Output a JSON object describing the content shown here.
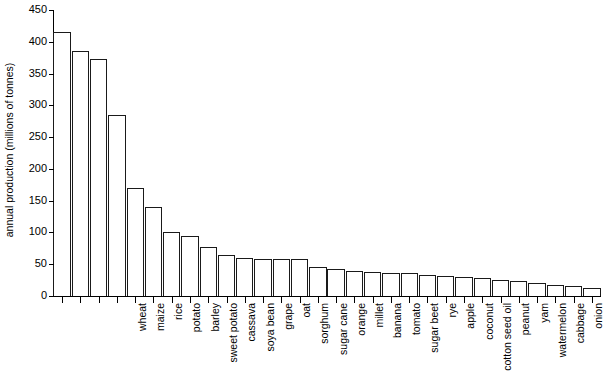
{
  "chart_data": {
    "type": "bar",
    "title": "",
    "xlabel": "",
    "ylabel": "annual production (millions of tonnes)",
    "ylim": [
      0,
      450
    ],
    "ytick_step": 50,
    "yticks": [
      0,
      50,
      100,
      150,
      200,
      250,
      300,
      350,
      400,
      450
    ],
    "ytick_labels": [
      "0",
      "50",
      "100",
      "150",
      "200",
      "250",
      "300",
      "350",
      "400",
      "450"
    ],
    "grid": false,
    "legend": null,
    "bar_color": "#ffffff",
    "bar_edge_color": "#1a1a1a",
    "axis_color": "#000000",
    "categories": [
      "wheat",
      "maize",
      "rice",
      "potato",
      "barley",
      "sweet potato",
      "cassava",
      "soya bean",
      "grape",
      "oat",
      "sorghum",
      "sugar cane",
      "orange",
      "millet",
      "banana",
      "tomato",
      "sugar beet",
      "rye",
      "apple",
      "coconut",
      "cotton seed oil",
      "peanut",
      "yam",
      "watermelon",
      "cabbage",
      "onion",
      "bean",
      "pea",
      "sunflower seed",
      "mango"
    ],
    "values": [
      415,
      385,
      373,
      285,
      170,
      140,
      100,
      95,
      77,
      65,
      60,
      58,
      58,
      58,
      45,
      42,
      40,
      38,
      37,
      36,
      33,
      31,
      30,
      28,
      25,
      23,
      20,
      17,
      15,
      13
    ]
  }
}
